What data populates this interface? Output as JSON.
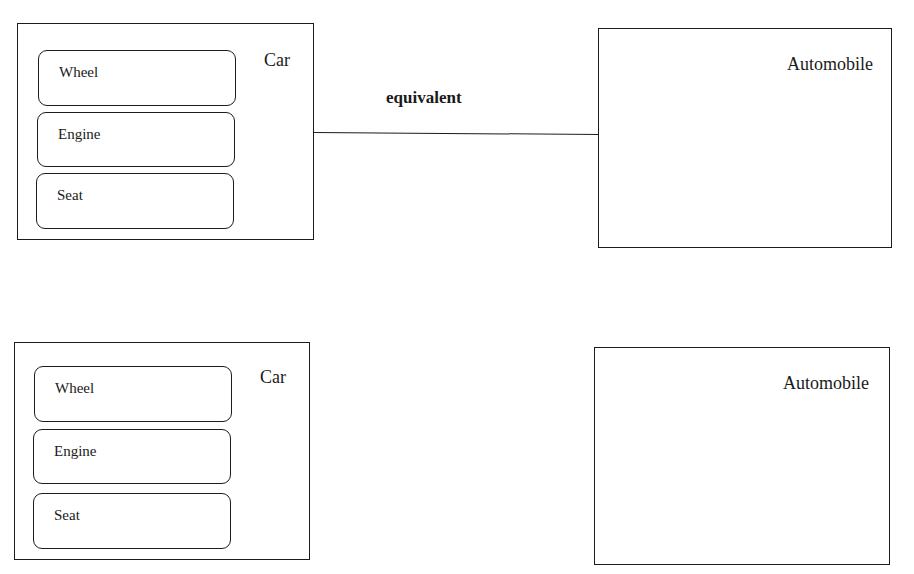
{
  "diagram": {
    "top": {
      "left_entity": {
        "title": "Car",
        "parts": [
          "Wheel",
          "Engine",
          "Seat"
        ]
      },
      "relation": {
        "label": "equivalent"
      },
      "right_entity": {
        "title": "Automobile"
      }
    },
    "bottom": {
      "left_entity": {
        "title": "Car",
        "parts": [
          "Wheel",
          "Engine",
          "Seat"
        ]
      },
      "right_entity": {
        "title": "Automobile"
      }
    }
  }
}
